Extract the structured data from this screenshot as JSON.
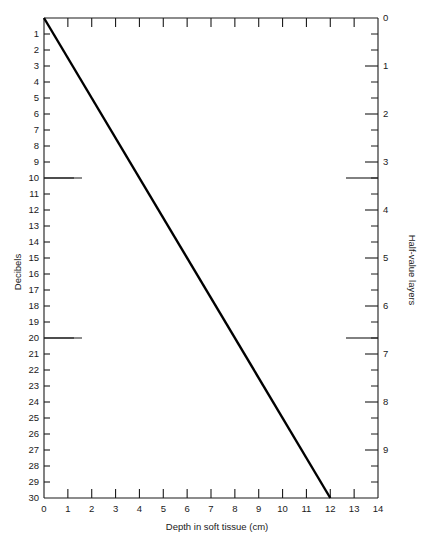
{
  "chart_data": {
    "type": "line",
    "title": "",
    "subtitle": "",
    "xlabel": "Depth in soft tissue (cm)",
    "ylabel": "Decibels",
    "y2label": "Half-value layers",
    "xlim": [
      0,
      14
    ],
    "ylim": [
      0,
      30
    ],
    "y2lim": [
      0,
      10
    ],
    "y_inverted": true,
    "y2_inverted": true,
    "grid": false,
    "legend": null,
    "x_ticks": [
      0,
      1,
      2,
      3,
      4,
      5,
      6,
      7,
      8,
      9,
      10,
      11,
      12,
      13,
      14
    ],
    "x_tick_labels": [
      "0",
      "1",
      "2",
      "3",
      "4",
      "5",
      "6",
      "7",
      "8",
      "9",
      "10",
      "11",
      "12",
      "13",
      "14"
    ],
    "y_ticks": [
      0,
      1,
      2,
      3,
      4,
      5,
      6,
      7,
      8,
      9,
      10,
      11,
      12,
      13,
      14,
      15,
      16,
      17,
      18,
      19,
      20,
      21,
      22,
      23,
      24,
      25,
      26,
      27,
      28,
      29,
      30
    ],
    "y_tick_labels": [
      "",
      "1",
      "2",
      "3",
      "4",
      "5",
      "6",
      "7",
      "8",
      "9",
      "10",
      "11",
      "12",
      "13",
      "14",
      "15",
      "16",
      "17",
      "18",
      "19",
      "20",
      "21",
      "22",
      "23",
      "24",
      "25",
      "26",
      "27",
      "28",
      "29",
      "30"
    ],
    "y_major_ticks": [
      0,
      10,
      20,
      30
    ],
    "y2_ticks": [
      0,
      1,
      2,
      3,
      4,
      5,
      6,
      7,
      8,
      9,
      10
    ],
    "y2_tick_labels": [
      "0",
      "1",
      "2",
      "3",
      "4",
      "5",
      "6",
      "7",
      "8",
      "9",
      ""
    ],
    "y2_major_ticks": [
      0,
      1,
      2,
      3,
      4,
      5,
      6,
      7,
      8,
      9,
      10
    ],
    "hvl_per_db": 3,
    "series": [
      {
        "name": "Attenuation",
        "x": [
          0,
          12
        ],
        "values": [
          0,
          30
        ],
        "slope_db_per_cm": 2.5,
        "color": "#000000"
      }
    ],
    "annotations": []
  },
  "figure": {
    "background_color": "#ffffff",
    "line_color": "#000000",
    "axis_color": "#1a1a1a"
  }
}
